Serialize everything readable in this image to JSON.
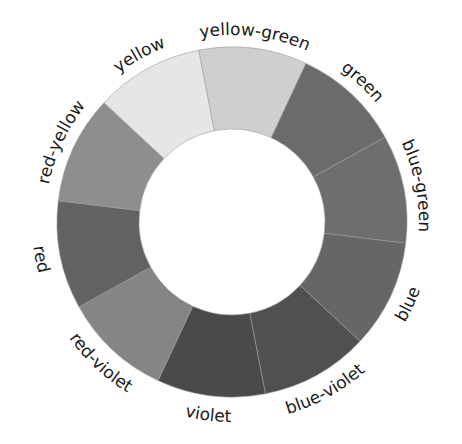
{
  "diagram": {
    "type": "color-wheel",
    "center": [
      232,
      222
    ],
    "outer_radius": 175,
    "inner_radius": 93,
    "start_angle": -11,
    "segments": [
      {
        "label": "yellow-green",
        "fill": "#cfcfcf"
      },
      {
        "label": "green",
        "fill": "#6b6b6b"
      },
      {
        "label": "blue-green",
        "fill": "#6e6e6e"
      },
      {
        "label": "blue",
        "fill": "#666666"
      },
      {
        "label": "blue-violet",
        "fill": "#505050"
      },
      {
        "label": "violet",
        "fill": "#4a4a4a"
      },
      {
        "label": "red-violet",
        "fill": "#858585"
      },
      {
        "label": "red",
        "fill": "#626262"
      },
      {
        "label": "red-yellow",
        "fill": "#8e8e8e"
      },
      {
        "label": "yellow",
        "fill": "#e6e6e6"
      }
    ],
    "divider_color": "#9a9a9a"
  }
}
